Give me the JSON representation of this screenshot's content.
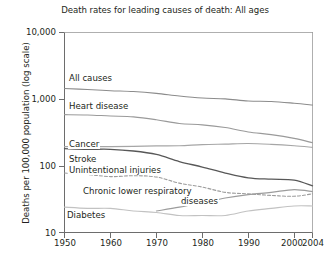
{
  "chart_data": {
    "type": "line",
    "title": "Death rates for leading causes of death: All ages",
    "xlabel": "Year",
    "ylabel": "Deaths per 100,000 population (log scale)",
    "yscale": "log",
    "ylim": [
      10,
      10000
    ],
    "xlim": [
      1950,
      2004
    ],
    "grid": false,
    "legend_position": "inline-labels",
    "y_ticks": [
      {
        "value": 10,
        "label": "10"
      },
      {
        "value": 100,
        "label": "100"
      },
      {
        "value": 1000,
        "label": "1,000"
      },
      {
        "value": 10000,
        "label": "10,000"
      }
    ],
    "x_ticks": [
      {
        "value": 1950,
        "label": "1950"
      },
      {
        "value": 1960,
        "label": "1960"
      },
      {
        "value": 1970,
        "label": "1970"
      },
      {
        "value": 1980,
        "label": "1980"
      },
      {
        "value": 1990,
        "label": "1990"
      },
      {
        "value": 2000,
        "label": "2000"
      },
      {
        "value": 2004,
        "label": "2004"
      }
    ],
    "x": [
      1950,
      1955,
      1960,
      1965,
      1970,
      1975,
      1980,
      1985,
      1990,
      1995,
      2000,
      2004
    ],
    "series": [
      {
        "name": "All causes",
        "label": "All causes",
        "color": "#8c8c8c",
        "style": "solid",
        "values": [
          1446,
          1393,
          1339,
          1302,
          1223,
          1113,
          1039,
          1010,
          939,
          924,
          869,
          817
        ]
      },
      {
        "name": "Heart disease",
        "label": "Heart disease",
        "color": "#9a9a9a",
        "style": "solid",
        "values": [
          586,
          580,
          559,
          543,
          492,
          431,
          412,
          375,
          322,
          294,
          258,
          222
        ]
      },
      {
        "name": "Cancer",
        "label": "Cancer",
        "color": "#a6a6a6",
        "style": "solid",
        "values": [
          194,
          195,
          194,
          196,
          199,
          200,
          208,
          212,
          216,
          210,
          200,
          189
        ]
      },
      {
        "name": "Stroke",
        "label": "Stroke",
        "color": "#585858",
        "style": "solid",
        "values": [
          181,
          177,
          177,
          167,
          148,
          116,
          96,
          78,
          66,
          63,
          61,
          50
        ]
      },
      {
        "name": "Unintentional injuries",
        "label": "Unintentional injuries",
        "color": "#9c9c9c",
        "style": "dashed",
        "values": [
          78,
          74,
          69,
          71,
          68,
          55,
          48,
          40,
          38,
          36,
          35,
          38
        ]
      },
      {
        "name": "Chronic lower respiratory diseases",
        "label": "Chronic lower respiratory diseases",
        "label_line1": "Chronic lower respiratory",
        "label_line2": "diseases",
        "color": "#9c9c9c",
        "style": "solid",
        "values": [
          null,
          null,
          null,
          null,
          21,
          24,
          28,
          33,
          37,
          40,
          44,
          41
        ]
      },
      {
        "name": "Diabetes",
        "label": "Diabetes",
        "color": "#c2c2c2",
        "style": "solid",
        "values": [
          24,
          23,
          23,
          21,
          20,
          18,
          18,
          18,
          21,
          23,
          25,
          25
        ]
      }
    ]
  }
}
